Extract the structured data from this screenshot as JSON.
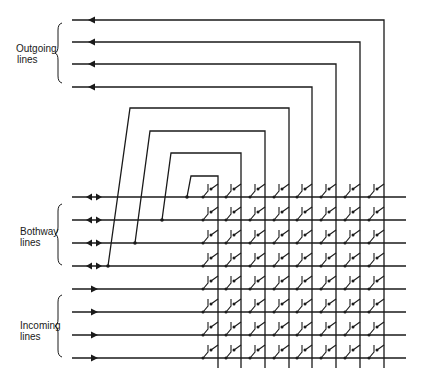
{
  "diagram": {
    "type": "crosspoint switching matrix",
    "groups": [
      {
        "id": "outgoing",
        "label_line1": "Outgoing",
        "label_line2": "lines",
        "count": 4,
        "direction": "out"
      },
      {
        "id": "bothway",
        "label_line1": "Bothway",
        "label_line2": "lines",
        "count": 4,
        "direction": "both"
      },
      {
        "id": "incoming",
        "label_line1": "Incoming",
        "label_line2": "lines",
        "count": 4,
        "direction": "in"
      }
    ],
    "matrix": {
      "rows": 8,
      "columns": 8
    },
    "colors": {
      "line": "#1a1a1a",
      "background": "#ffffff"
    }
  }
}
